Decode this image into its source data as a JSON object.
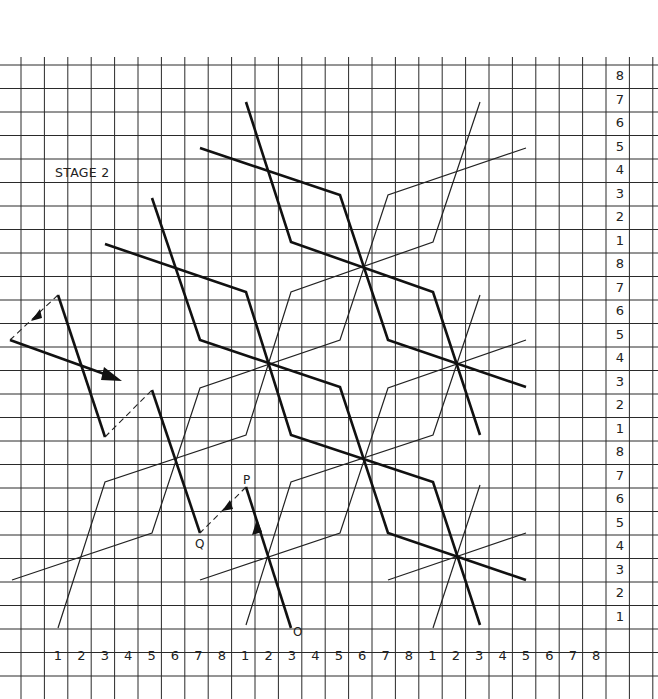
{
  "title": "STAGE 2",
  "grid": {
    "origin_x": 21,
    "origin_y": 65,
    "cell_w": 23.4,
    "cell_h": 23.5,
    "cols": 28,
    "rows": 27,
    "line_color": "#2a2a2a"
  },
  "column_labels": {
    "row_y": 660,
    "start_x": 58,
    "values": [
      "1",
      "2",
      "3",
      "4",
      "5",
      "6",
      "7",
      "8",
      "1",
      "2",
      "3",
      "4",
      "5",
      "6",
      "7",
      "8",
      "1",
      "2",
      "3",
      "4",
      "5",
      "6",
      "7",
      "8"
    ]
  },
  "row_labels": {
    "col_x": 620,
    "start_y": 80,
    "values": [
      "8",
      "7",
      "6",
      "5",
      "4",
      "3",
      "2",
      "1",
      "8",
      "7",
      "6",
      "5",
      "4",
      "3",
      "2",
      "1",
      "8",
      "7",
      "6",
      "5",
      "4",
      "3",
      "2",
      "1"
    ]
  },
  "point_labels": [
    {
      "id": "P",
      "text": "P",
      "x": 243,
      "y": 484
    },
    {
      "id": "Q",
      "text": "Q",
      "x": 195,
      "y": 548
    },
    {
      "id": "O",
      "text": "O",
      "x": 293,
      "y": 636
    }
  ],
  "paths": {
    "thick": [
      {
        "name": "thick-path-a",
        "points": "246,102 291,242 433,292 480,435"
      },
      {
        "name": "thick-path-b",
        "points": "200,148 340,195 388,340 526,387"
      },
      {
        "name": "thick-path-c",
        "points": "152,198 200,340 340,387 388,533 526,580"
      },
      {
        "name": "thick-path-d",
        "points": "105,244 246,292 291,435 433,482 480,625"
      },
      {
        "name": "thick-path-left-zig",
        "points": "58,295 105,437"
      },
      {
        "name": "thick-path-left-zig2",
        "points": "152,390 200,533"
      },
      {
        "name": "thick-path-op",
        "points": "246,487 291,628"
      },
      {
        "name": "thick-path-arrow-start",
        "points": "10,340 110,376"
      }
    ],
    "thin": [
      {
        "name": "thin-path-e",
        "points": "480,102 433,242 291,292 246,435 105,482 58,628"
      },
      {
        "name": "thin-path-f",
        "points": "526,148 388,195 340,340 200,388 152,533 12,580"
      },
      {
        "name": "thin-path-g",
        "points": "480,295 433,435 291,482 246,625"
      },
      {
        "name": "thin-path-h",
        "points": "526,340 388,388 340,533 200,580"
      },
      {
        "name": "thin-path-i",
        "points": "480,485 433,628"
      },
      {
        "name": "thin-path-j",
        "points": "526,533 388,580"
      }
    ],
    "dashed": [
      {
        "name": "dashed-path-top-left",
        "points": "58,295 10,340"
      },
      {
        "name": "dashed-path-mid-left",
        "points": "105,437 152,390"
      },
      {
        "name": "dashed-path-pq",
        "points": "246,487 200,533"
      }
    ],
    "arrowheads": [
      {
        "name": "arrowhead-main-right",
        "points": "122,381 104,367 101,380"
      },
      {
        "name": "arrowhead-dashed-top-left",
        "points": "31,321 40,309 42,318"
      },
      {
        "name": "arrowhead-dashed-pq",
        "points": "222,511 230,500 233,509"
      },
      {
        "name": "arrowhead-op-up",
        "points": "257,519 252,535 262,532"
      }
    ]
  }
}
